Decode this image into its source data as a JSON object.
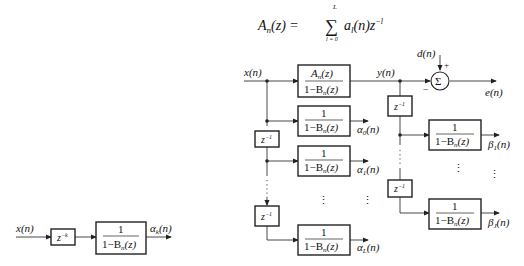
{
  "equation": {
    "lhs": "A",
    "lhs_sub": "n",
    "lhs_arg": "(z) =",
    "sum_upper": "L",
    "sum_lower": "l = 0",
    "term": "a",
    "term_sub": "l",
    "term_arg": "(n)z",
    "term_exp": "−l"
  },
  "main_diagram": {
    "input": "x(n)",
    "output": "y(n)",
    "desired": "d(n)",
    "error": "e(n)",
    "sum_symbol": "Σ",
    "plus": "+",
    "minus": "−",
    "main_block": {
      "num": "A",
      "num_sub": "n",
      "num_arg": "(z)",
      "den": "1−B",
      "den_sub": "n",
      "den_arg": "(z)"
    },
    "delay": "z",
    "delay_exp": "−1",
    "alpha_blocks": [
      {
        "num": "1",
        "den": "1−B",
        "den_sub": "n",
        "den_arg": "(z)",
        "out": "α",
        "out_sub": "0",
        "out_arg": "(n)"
      },
      {
        "num": "1",
        "den": "1−B",
        "den_sub": "n",
        "den_arg": "(z)",
        "out": "α",
        "out_sub": "1",
        "out_arg": "(n)"
      },
      {
        "num": "1",
        "den": "1−B",
        "den_sub": "n",
        "den_arg": "(z)",
        "out": "α",
        "out_sub": "L",
        "out_arg": "(n)"
      }
    ],
    "beta_blocks": [
      {
        "num": "1",
        "den": "1−B",
        "den_sub": "n",
        "den_arg": "(z)",
        "out": "β",
        "out_sub": "1",
        "out_arg": "(n)"
      },
      {
        "num": "1",
        "den": "1−B",
        "den_sub": "n",
        "den_arg": "(z)",
        "out": "β",
        "out_sub": "J",
        "out_arg": "(n)"
      }
    ],
    "ellipsis": "⋮"
  },
  "small_diagram": {
    "input": "x(n)",
    "delay": "z",
    "delay_exp": "−k",
    "block": {
      "num": "1",
      "den": "1−B",
      "den_sub": "n",
      "den_arg": "(z)"
    },
    "out": "α",
    "out_sub": "k",
    "out_arg": "(n)"
  }
}
